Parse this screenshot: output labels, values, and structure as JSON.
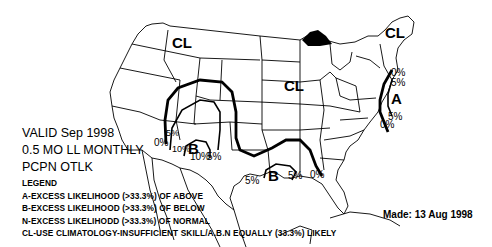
{
  "title": {
    "valid": "VALID Sep 1998",
    "product": "0.5 MO LL MONTHLY",
    "type": "PCPN OTLK"
  },
  "legend": {
    "heading": "LEGEND",
    "items": [
      "A-EXCESS LIKELIHOOD (>33.3%) OF ABOVE",
      "B-EXCESS LIKELIHOOD (>33.3%) OF BELOW",
      "N-EXCESS LIKELIHODD (>33.3%) OF NORMAL",
      "CL-USE CLIMATOLOGY-INSUFFICIENT SKILL/A.B.N EQUALLY (33.3%) LIKELY"
    ]
  },
  "made": "Made: 13 Aug 1998",
  "map": {
    "region_labels": {
      "cl_northwest": "CL",
      "cl_central": "CL",
      "cl_northeast": "CL",
      "a_east": "A",
      "b_southwest": "B",
      "b_texas": "B"
    },
    "contour_labels": {
      "sw_5": "5%",
      "sw_0": "0%",
      "sw_10a": "10%",
      "sw_10b": "10%",
      "sw_5b": "5%",
      "tx_5a": "5%",
      "tx_5b": "5%",
      "tx_0": "0%",
      "ne_0": "0%",
      "ne_5": "5%",
      "se_5": "5%",
      "se_0": "0%"
    }
  }
}
